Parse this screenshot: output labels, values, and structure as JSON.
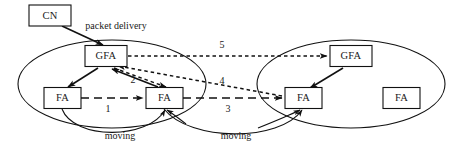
{
  "diagram": {
    "regions": [
      {
        "id": "left-domain",
        "label": ""
      },
      {
        "id": "right-domain",
        "label": ""
      }
    ],
    "nodes": [
      {
        "id": "cn",
        "label": "CN",
        "x": 50,
        "y": 15
      },
      {
        "id": "gfa-left",
        "label": "GFA",
        "x": 106,
        "y": 56
      },
      {
        "id": "fa-left-1",
        "label": "FA",
        "x": 62,
        "y": 98
      },
      {
        "id": "fa-left-2",
        "label": "FA",
        "x": 164,
        "y": 98
      },
      {
        "id": "gfa-right",
        "label": "GFA",
        "x": 351,
        "y": 56
      },
      {
        "id": "fa-right-1",
        "label": "FA",
        "x": 303,
        "y": 98
      },
      {
        "id": "fa-right-2",
        "label": "FA",
        "x": 401,
        "y": 98
      }
    ],
    "edge_labels": [
      {
        "id": "packet-delivery",
        "text": "packet delivery",
        "x": 116,
        "y": 27
      },
      {
        "id": "step-1",
        "text": "1",
        "x": 108,
        "y": 110
      },
      {
        "id": "step-2",
        "text": "2",
        "x": 133,
        "y": 81
      },
      {
        "id": "step-3",
        "text": "3",
        "x": 228,
        "y": 110
      },
      {
        "id": "step-4",
        "text": "4",
        "x": 222,
        "y": 82
      },
      {
        "id": "step-5",
        "text": "5",
        "x": 222,
        "y": 46
      },
      {
        "id": "moving-left",
        "text": "moving",
        "x": 120,
        "y": 137
      },
      {
        "id": "moving-right",
        "text": "moving",
        "x": 236,
        "y": 137
      }
    ],
    "colors": {
      "stroke": "#111111",
      "text": "#1a1a1a",
      "background": "#ffffff"
    }
  }
}
